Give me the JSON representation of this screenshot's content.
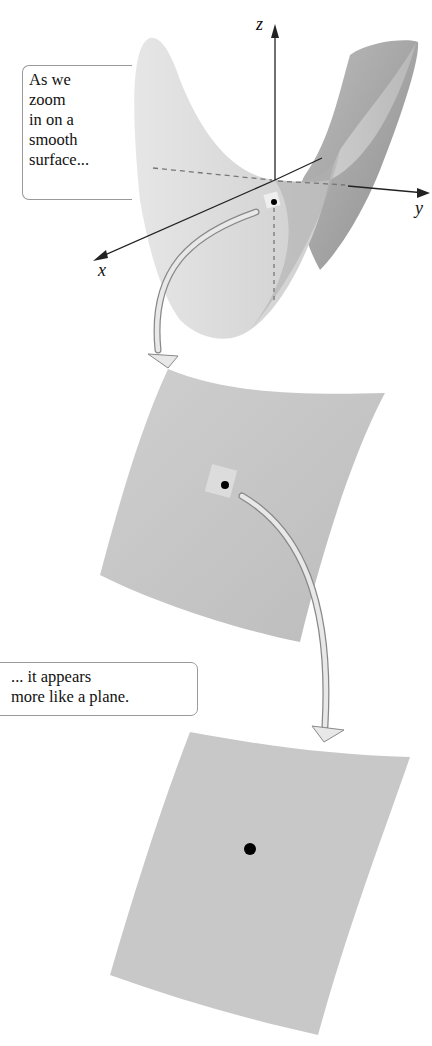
{
  "callouts": {
    "top": "As we zoom in on a smooth surface...",
    "top_lines": [
      "As we",
      "zoom",
      "in on a",
      "smooth",
      "surface..."
    ],
    "bottom_lines": [
      "... it appears",
      "more like a plane."
    ]
  },
  "axes": {
    "x": "x",
    "y": "y",
    "z": "z"
  },
  "figure": {
    "panels": [
      "saddle-surface",
      "zoomed-surface",
      "near-plane-surface"
    ],
    "surface_color": "#c8c8c8",
    "point_color": "#000000"
  }
}
